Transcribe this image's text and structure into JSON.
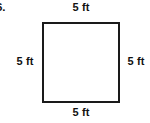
{
  "figure": {
    "problem_number": "6.",
    "shape": {
      "kind": "square",
      "stroke_color": "#1a1a1a",
      "fill_color": "#ffffff",
      "stroke_width_px": 2
    },
    "labels": {
      "top": "5 ft",
      "right": "5 ft",
      "bottom": "5 ft",
      "left": "5 ft"
    },
    "background_color": "#ffffff",
    "text_color": "#111111"
  }
}
